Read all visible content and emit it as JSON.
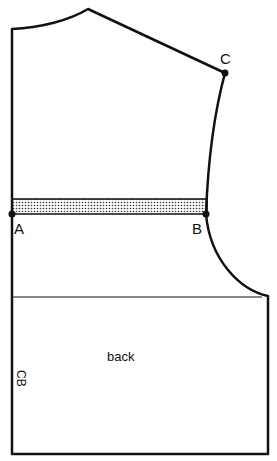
{
  "diagram": {
    "labels": {
      "point_a": "A",
      "point_b": "B",
      "point_c": "C",
      "piece_name": "back",
      "center_back": "CB"
    },
    "colors": {
      "stroke": "#111111",
      "background": "#ffffff",
      "shaded_band": "#cccccc"
    }
  }
}
